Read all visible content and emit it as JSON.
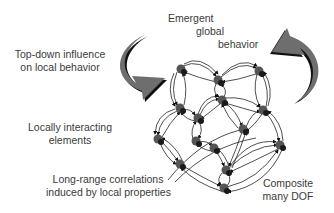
{
  "diagram": {
    "labels": {
      "emergent": [
        "Emergent",
        "global",
        "behavior"
      ],
      "top_down": [
        "Top-down influence",
        "on local behavior"
      ],
      "locally": [
        "Locally interacting",
        "elements"
      ],
      "long_range": [
        "Long-range correlations",
        "induced by local properties"
      ],
      "composite": [
        "Composite",
        "many DOF"
      ]
    },
    "colors": {
      "arrow_fill": "#6e6e6e",
      "arrow_shadow": "#111111",
      "node": "#555555",
      "node_dark": "#1a1a1a",
      "text": "#3a3a3a",
      "line": "#222222"
    }
  }
}
